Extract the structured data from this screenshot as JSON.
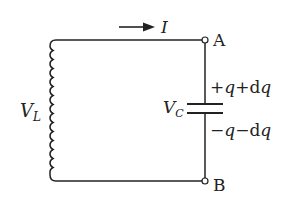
{
  "diagram": {
    "type": "LC circuit",
    "current_label": "I",
    "terminal_a": "A",
    "terminal_b": "B",
    "inductor_voltage": {
      "main": "V",
      "sub": "L"
    },
    "capacitor_voltage": {
      "main": "V",
      "sub": "C"
    },
    "top_plate_charge": "+q+dq",
    "bottom_plate_charge": "−q−dq",
    "top_plate_parts": [
      "+",
      "q",
      "+",
      "d",
      "q"
    ],
    "bottom_plate_parts": [
      "−",
      "q",
      "−",
      "d",
      "q"
    ],
    "line_color": "#222222"
  }
}
